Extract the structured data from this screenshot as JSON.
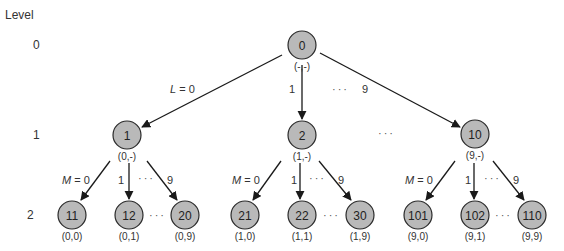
{
  "legend": {
    "level_header": "Level",
    "levels": [
      {
        "label": "0",
        "x": 33,
        "y": 49
      },
      {
        "label": "1",
        "x": 33,
        "y": 139
      },
      {
        "label": "2",
        "x": 27,
        "y": 219
      }
    ]
  },
  "node_style": {
    "fill": "#b9b9b9",
    "stroke": "#2a2a2a",
    "radius": 14
  },
  "nodes": [
    {
      "id": "0",
      "pair": "(-,-)",
      "x": 302,
      "y": 45,
      "level": 0
    },
    {
      "id": "1",
      "pair": "(0,-)",
      "x": 127,
      "y": 135,
      "level": 1
    },
    {
      "id": "2",
      "pair": "(1,-)",
      "x": 302,
      "y": 135,
      "level": 1
    },
    {
      "id": "10",
      "pair": "(9,-)",
      "x": 475,
      "y": 134,
      "level": 1
    },
    {
      "id": "11",
      "pair": "(0,0)",
      "x": 72,
      "y": 215,
      "level": 2
    },
    {
      "id": "12",
      "pair": "(0,1)",
      "x": 129,
      "y": 215,
      "level": 2
    },
    {
      "id": "20",
      "pair": "(0,9)",
      "x": 185,
      "y": 215,
      "level": 2
    },
    {
      "id": "21",
      "pair": "(1,0)",
      "x": 245,
      "y": 215,
      "level": 2
    },
    {
      "id": "22",
      "pair": "(1,1)",
      "x": 302,
      "y": 215,
      "level": 2
    },
    {
      "id": "30",
      "pair": "(1,9)",
      "x": 360,
      "y": 215,
      "level": 2
    },
    {
      "id": "101",
      "pair": "(9,0)",
      "x": 418,
      "y": 215,
      "level": 2
    },
    {
      "id": "102",
      "pair": "(9,1)",
      "x": 475,
      "y": 215,
      "level": 2
    },
    {
      "id": "110",
      "pair": "(9,9)",
      "x": 532,
      "y": 215,
      "level": 2
    }
  ],
  "edges": [
    {
      "from": "0",
      "to": "1",
      "x1": 282,
      "y1": 55,
      "x2": 142,
      "y2": 127,
      "label": "L = 0",
      "italic_var": "L",
      "rest": " = 0",
      "lx": 170,
      "ly": 93
    },
    {
      "from": "0",
      "to": "2",
      "x1": 302,
      "y1": 65,
      "x2": 302,
      "y2": 119,
      "label": "1",
      "lx": 289,
      "ly": 93
    },
    {
      "from": "0",
      "to": "10",
      "x1": 320,
      "y1": 53,
      "x2": 460,
      "y2": 127,
      "label": "9",
      "lx": 362,
      "ly": 93
    },
    {
      "from": "1",
      "to": "11",
      "x1": 110,
      "y1": 161,
      "x2": 81,
      "y2": 200,
      "label": "M = 0",
      "italic_var": "M",
      "rest": " = 0",
      "lx": 62,
      "ly": 184
    },
    {
      "from": "1",
      "to": "12",
      "x1": 129,
      "y1": 163,
      "x2": 129,
      "y2": 199,
      "label": "1",
      "lx": 118,
      "ly": 184
    },
    {
      "from": "1",
      "to": "20",
      "x1": 147,
      "y1": 161,
      "x2": 177,
      "y2": 200,
      "label": "9",
      "lx": 167,
      "ly": 184
    },
    {
      "from": "2",
      "to": "21",
      "x1": 281,
      "y1": 161,
      "x2": 253,
      "y2": 200,
      "label": "M = 0",
      "italic_var": "M",
      "rest": " = 0",
      "lx": 232,
      "ly": 184
    },
    {
      "from": "2",
      "to": "22",
      "x1": 300,
      "y1": 163,
      "x2": 300,
      "y2": 199,
      "label": "1",
      "lx": 291,
      "ly": 184
    },
    {
      "from": "2",
      "to": "30",
      "x1": 319,
      "y1": 161,
      "x2": 351,
      "y2": 200,
      "label": "9",
      "lx": 338,
      "ly": 184
    },
    {
      "from": "10",
      "to": "101",
      "x1": 455,
      "y1": 161,
      "x2": 426,
      "y2": 200,
      "label": "M = 0",
      "italic_var": "M",
      "rest": " = 0",
      "lx": 405,
      "ly": 184
    },
    {
      "from": "10",
      "to": "102",
      "x1": 474,
      "y1": 163,
      "x2": 474,
      "y2": 199,
      "label": "1",
      "lx": 465,
      "ly": 184
    },
    {
      "from": "10",
      "to": "110",
      "x1": 493,
      "y1": 161,
      "x2": 524,
      "y2": 200,
      "label": "9",
      "lx": 513,
      "ly": 184
    }
  ],
  "ellipses": [
    {
      "text": "···",
      "x": 332,
      "y": 93
    },
    {
      "text": "···",
      "x": 378,
      "y": 137
    },
    {
      "text": "···",
      "x": 138,
      "y": 182
    },
    {
      "text": "···",
      "x": 309,
      "y": 182
    },
    {
      "text": "···",
      "x": 484,
      "y": 182
    },
    {
      "text": "···",
      "x": 149,
      "y": 219
    },
    {
      "text": "···",
      "x": 323,
      "y": 219
    },
    {
      "text": "···",
      "x": 495,
      "y": 219
    }
  ]
}
